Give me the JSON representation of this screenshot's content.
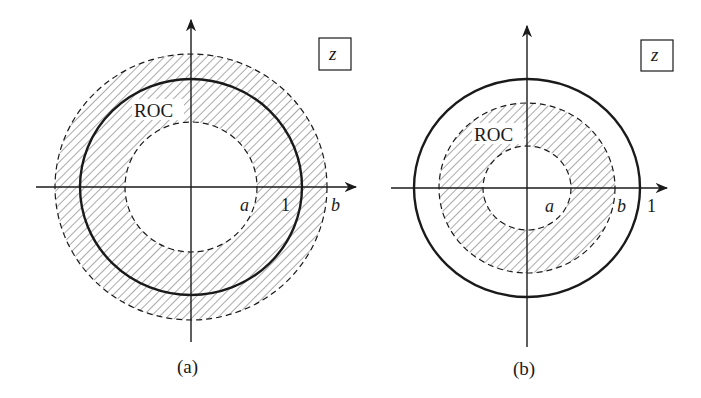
{
  "figure": {
    "panels": [
      {
        "id": "a",
        "caption": "(a)",
        "plane_label": "z",
        "roc_label": "ROC",
        "axis_labels": {
          "a": "a",
          "one": "1",
          "b": "b"
        },
        "description": "ROC is annulus a < |z| < b with b > 1; includes unit circle"
      },
      {
        "id": "b",
        "caption": "(b)",
        "plane_label": "z",
        "roc_label": "ROC",
        "axis_labels": {
          "a": "a",
          "b": "b",
          "one": "1"
        },
        "description": "ROC is annulus a < |z| < b with b < 1; does not include unit circle"
      }
    ],
    "colors": {
      "stroke": "#1a1a1a",
      "hatch": "#555555",
      "background": "#ffffff"
    }
  }
}
